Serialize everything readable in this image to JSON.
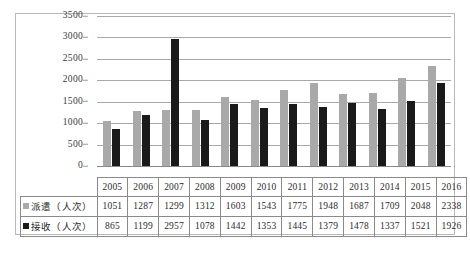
{
  "chart_data": {
    "type": "bar",
    "title": "",
    "xlabel": "",
    "ylabel": "",
    "ylim": [
      0,
      3500
    ],
    "yticks": [
      0,
      500,
      1000,
      1500,
      2000,
      2500,
      3000,
      3500
    ],
    "grid": true,
    "legend_position": "table-row-headers",
    "categories": [
      "2005",
      "2006",
      "2007",
      "2008",
      "2009",
      "2010",
      "2011",
      "2012",
      "2013",
      "2014",
      "2015",
      "2016"
    ],
    "series": [
      {
        "name": "派遣（人次）",
        "color": "#a9a9a9",
        "values": [
          1051,
          1287,
          1299,
          1312,
          1603,
          1543,
          1775,
          1948,
          1687,
          1709,
          2048,
          2338
        ]
      },
      {
        "name": "接收（人次）",
        "color": "#1a1a1a",
        "values": [
          865,
          1199,
          2957,
          1078,
          1442,
          1353,
          1445,
          1379,
          1478,
          1337,
          1521,
          1926
        ]
      }
    ]
  },
  "table": {
    "header_corner": "",
    "year_row": [
      "2005",
      "2006",
      "2007",
      "2008",
      "2009",
      "2010",
      "2011",
      "2012",
      "2013",
      "2014",
      "2015",
      "2016"
    ],
    "rows": [
      {
        "label": "派遣（人次）",
        "swatch": "square-gray-icon",
        "values": [
          "1051",
          "1287",
          "1299",
          "1312",
          "1603",
          "1543",
          "1775",
          "1948",
          "1687",
          "1709",
          "2048",
          "2338"
        ]
      },
      {
        "label": "接收（人次）",
        "swatch": "square-black-icon",
        "values": [
          "865",
          "1199",
          "2957",
          "1078",
          "1442",
          "1353",
          "1445",
          "1379",
          "1478",
          "1337",
          "1521",
          "1926"
        ]
      }
    ]
  },
  "axis": {
    "y_tick_labels": [
      "3500",
      "3000",
      "2500",
      "2000",
      "1500",
      "1000",
      "500",
      "0"
    ]
  },
  "colors": {
    "series_dispatch": "#a9a9a9",
    "series_receive": "#1a1a1a",
    "gridline": "#a9a9a9",
    "frame": "#b8b8b8",
    "table_border": "#8a8a8a"
  }
}
